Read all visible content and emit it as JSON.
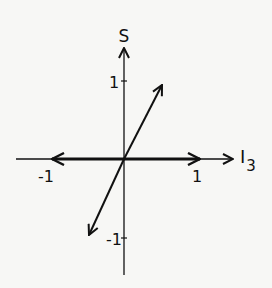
{
  "diagram": {
    "axes": {
      "horizontal": {
        "label": "I",
        "subscript": "3",
        "ticks": [
          {
            "value": "-1"
          },
          {
            "value": "1"
          }
        ]
      },
      "vertical": {
        "label": "S",
        "ticks": [
          {
            "value": "1"
          },
          {
            "value": "-1"
          }
        ]
      }
    },
    "vectors": [
      {
        "name": "I3 = +1",
        "from": [
          0,
          0
        ],
        "to": [
          1,
          0
        ],
        "style": "thick"
      },
      {
        "name": "I3 = -1",
        "from": [
          0,
          0
        ],
        "to": [
          -1,
          0
        ],
        "style": "thick"
      },
      {
        "name": "upper-right",
        "from": [
          0,
          0
        ],
        "to": [
          0.5,
          1
        ],
        "style": "thin"
      },
      {
        "name": "lower-left",
        "from": [
          0,
          0
        ],
        "to": [
          -0.5,
          -1
        ],
        "style": "thin"
      }
    ],
    "colors": {
      "ink": "#111111",
      "background": "#f7f7f5"
    }
  }
}
